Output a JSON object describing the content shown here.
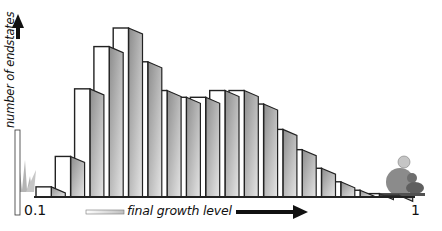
{
  "chart_data": {
    "type": "bar",
    "title": "",
    "xlabel": "final growth level",
    "ylabel": "number of endstates",
    "x_tick_labels": {
      "start": "0.1",
      "end": "1"
    },
    "xlim": [
      0.1,
      1
    ],
    "ylim": [
      0,
      100
    ],
    "y_units": "relative (tallest bar = 100)",
    "grid": false,
    "legend": "none",
    "style": "3D extruded bars with gray shaded sides",
    "bars": 19,
    "values": [
      6,
      24,
      64,
      89,
      100,
      80,
      63,
      59,
      59,
      63,
      63,
      55,
      40,
      28,
      17,
      9,
      4,
      2,
      1
    ],
    "colors": {
      "bar_face": "#ffffff",
      "bar_outline": "#222222",
      "bar_side": "#a8a8a8",
      "axis": "#111111"
    }
  }
}
